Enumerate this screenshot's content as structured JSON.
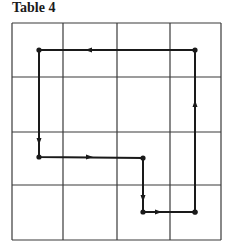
{
  "title": "Table 4",
  "grid": {
    "left": 12,
    "top": 23,
    "right": 221,
    "bottom": 240,
    "cols": 4,
    "rows": 4,
    "vlines": [
      12,
      63,
      117,
      170,
      221
    ],
    "hlines": [
      23,
      77,
      132,
      185,
      240
    ],
    "line_color": "#3a3a3a"
  },
  "path": {
    "color": "#1a1a1a",
    "points": [
      {
        "x": 195,
        "y": 212
      },
      {
        "x": 195,
        "y": 50
      },
      {
        "x": 39,
        "y": 50
      },
      {
        "x": 39,
        "y": 157
      },
      {
        "x": 143,
        "y": 158
      },
      {
        "x": 143,
        "y": 212
      },
      {
        "x": 195,
        "y": 212
      }
    ],
    "arrows": [
      {
        "x": 195,
        "y": 105,
        "dir": "up"
      },
      {
        "x": 90,
        "y": 50,
        "dir": "left"
      },
      {
        "x": 39,
        "y": 140,
        "dir": "down"
      },
      {
        "x": 88,
        "y": 157,
        "dir": "right"
      },
      {
        "x": 143,
        "y": 197,
        "dir": "down"
      },
      {
        "x": 157,
        "y": 212,
        "dir": "right"
      }
    ]
  }
}
